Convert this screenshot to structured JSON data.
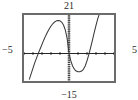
{
  "item": {
    "label": ")"
  },
  "axis_labels": {
    "ymax": "21",
    "ymin": "−15",
    "xmin": "−5",
    "xmax": "5"
  },
  "colors": {
    "frame": "#6b6b6b",
    "axis": "#1a1a1a",
    "curve": "#3a3a3a",
    "background": "#ffffff",
    "label": "#2a2a2a"
  },
  "chart_data": {
    "type": "line",
    "title": "",
    "xlabel": "",
    "ylabel": "",
    "xlim": [
      -5,
      5
    ],
    "ylim": [
      -15,
      21
    ],
    "grid": false,
    "legend": null,
    "axes": {
      "x_axis_visible": true,
      "y_axis_visible": true,
      "x_axis_style": "solid-with-ticks",
      "y_axis_style": "dotted-ticks",
      "x_tick_count": 10,
      "y_tick_count": 36,
      "x_tick_step": 1,
      "y_tick_step": 1
    },
    "annotations": [
      {
        "text": "21",
        "position": "top",
        "value": 21
      },
      {
        "text": "−15",
        "position": "bottom",
        "value": -15
      },
      {
        "text": "−5",
        "position": "left",
        "value": -5
      },
      {
        "text": "5",
        "position": "right",
        "value": 5
      }
    ],
    "series": [
      {
        "name": "cubic",
        "shape": "cubic with local maximum left of origin, passing through the origin, local minimum right of origin, rising steeply at right",
        "features": {
          "local_maximum": {
            "x": -1.75,
            "y": 19.5
          },
          "local_minimum": {
            "x": 2.0,
            "y": -10.0
          },
          "x_intercepts": [
            -3.2,
            0.0,
            3.2
          ],
          "y_intercept": 0.0
        },
        "x": [
          -4.4,
          -4.2,
          -4.0,
          -3.8,
          -3.6,
          -3.4,
          -3.2,
          -3.0,
          -2.8,
          -2.6,
          -2.4,
          -2.2,
          -2.0,
          -1.8,
          -1.6,
          -1.4,
          -1.2,
          -1.0,
          -0.8,
          -0.6,
          -0.4,
          -0.2,
          0.0,
          0.2,
          0.4,
          0.6,
          0.8,
          1.0,
          1.2,
          1.4,
          1.6,
          1.8,
          2.0,
          2.2,
          2.4,
          2.6,
          2.8,
          3.0,
          3.2,
          3.4,
          3.6,
          3.8,
          4.0,
          4.2,
          4.4,
          4.6
        ],
        "y": [
          -14.0,
          -11.0,
          -8.0,
          -5.0,
          -2.4,
          0.2,
          2.6,
          5.0,
          7.4,
          9.6,
          11.6,
          13.4,
          15.0,
          16.2,
          17.2,
          17.8,
          18.0,
          17.8,
          17.0,
          15.4,
          12.6,
          8.0,
          0.0,
          -4.0,
          -6.8,
          -8.6,
          -9.6,
          -10.0,
          -10.0,
          -9.6,
          -8.6,
          -6.8,
          -4.0,
          -0.6,
          3.2,
          7.2,
          11.4,
          15.4,
          19.0,
          22.0,
          24.0,
          25.0,
          25.2,
          25.0,
          24.4,
          23.6
        ]
      }
    ]
  }
}
